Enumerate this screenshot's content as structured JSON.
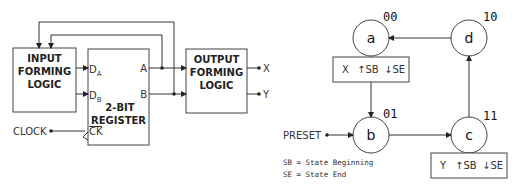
{
  "circuit": {
    "input_block": {
      "line1": "INPUT",
      "line2": "FORMING",
      "line3": "LOGIC"
    },
    "register_block": {
      "line1": "2-BIT",
      "line2": "REGISTER",
      "input_a": "D",
      "input_a_sub": "A",
      "input_b": "D",
      "input_b_sub": "B",
      "clock_input": "CK",
      "output_a": "A",
      "output_b": "B"
    },
    "output_block": {
      "line1": "OUTPUT",
      "line2": "FORMING",
      "line3": "LOGIC"
    },
    "clock_label": "CLOCK",
    "outputs": [
      "X",
      "Y"
    ]
  },
  "state_diagram": {
    "states": [
      {
        "name": "a",
        "code": "00"
      },
      {
        "name": "b",
        "code": "01"
      },
      {
        "name": "c",
        "code": "11"
      },
      {
        "name": "d",
        "code": "10"
      }
    ],
    "action_boxes": [
      {
        "state": "a",
        "output": "X",
        "sb": "↑SB",
        "se": "↓SE"
      },
      {
        "state": "c",
        "output": "Y",
        "sb": "↑SB",
        "se": "↓SE"
      }
    ],
    "preset_label": "PRESET",
    "legend": [
      "SB = State Beginning",
      "SE = State End"
    ],
    "transitions": [
      [
        "a",
        "b"
      ],
      [
        "b",
        "c"
      ],
      [
        "c",
        "d"
      ],
      [
        "d",
        "a"
      ]
    ]
  }
}
